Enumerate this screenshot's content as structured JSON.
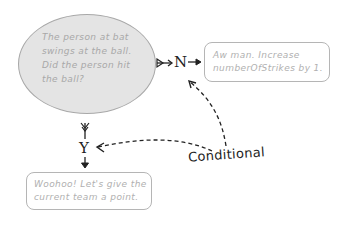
{
  "diagram": {
    "decision": {
      "text": "The person at bat swings at the ball. Did the person hit the ball?",
      "lines": [
        "The person at bat",
        "swings at the ball.",
        "Did the person hit",
        "the ball?"
      ]
    },
    "branch_no": {
      "label": "N",
      "action_lines": [
        "Aw man. Increase",
        "numberOfStrikes by 1."
      ]
    },
    "branch_yes": {
      "label": "Y",
      "action_lines": [
        "Woohoo! Let's give the",
        "current team a point."
      ]
    },
    "annotation": {
      "label": "Conditional"
    },
    "colors": {
      "decision_fill": "#e4e4e4",
      "border": "#a8a8a8",
      "muted_text": "#a8a8a8",
      "ink": "#222222"
    }
  }
}
